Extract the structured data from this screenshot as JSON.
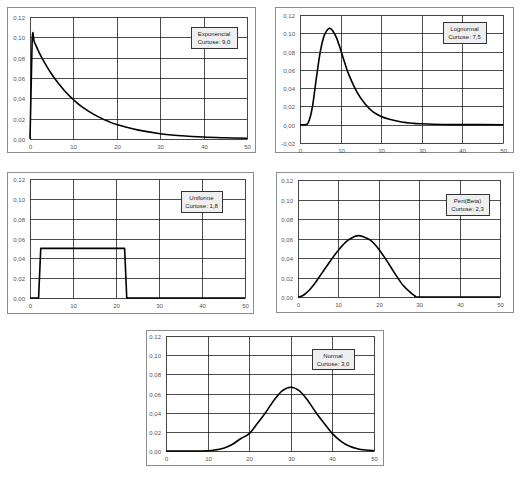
{
  "chart_data": [
    {
      "id": "exponencial",
      "type": "line",
      "title": "",
      "annotation": [
        "Exponencial",
        "Curtose: 9,0"
      ],
      "xlabel": "",
      "ylabel": "",
      "xlim": [
        0,
        50
      ],
      "ylim": [
        0,
        0.12
      ],
      "xticks": [
        "0",
        "10",
        "20",
        "30",
        "40",
        "50"
      ],
      "yticks": [
        "0,00",
        "0,02",
        "0,04",
        "0,06",
        "0,08",
        "0,10",
        "0,12"
      ],
      "grid": true,
      "legend": "none",
      "x": [
        0,
        0.5,
        1,
        2,
        3,
        4,
        5,
        6,
        8,
        10,
        12,
        15,
        18,
        20,
        25,
        30,
        35,
        40,
        45,
        50
      ],
      "values": [
        0,
        0.098,
        0.0953,
        0.086,
        0.0778,
        0.0704,
        0.0637,
        0.0577,
        0.0472,
        0.0387,
        0.0316,
        0.0235,
        0.0174,
        0.0142,
        0.0087,
        0.0052,
        0.0032,
        0.0019,
        0.0012,
        0.0007
      ]
    },
    {
      "id": "lognormal",
      "type": "line",
      "title": "",
      "annotation": [
        "Lognormal",
        "Curtose: 7,5"
      ],
      "xlabel": "",
      "ylabel": "",
      "xlim": [
        0,
        50
      ],
      "ylim": [
        -0.02,
        0.12
      ],
      "xticks": [
        "0",
        "10",
        "20",
        "30",
        "40",
        "50"
      ],
      "yticks": [
        "-0,02",
        "0,00",
        "0,02",
        "0,04",
        "0,06",
        "0,08",
        "0,10",
        "0,12"
      ],
      "grid": true,
      "legend": "none",
      "x": [
        0,
        1,
        2,
        3,
        4,
        5,
        6,
        7,
        7.5,
        8,
        9,
        10,
        11,
        12,
        14,
        16,
        18,
        20,
        22,
        25,
        28,
        30,
        35,
        40,
        50
      ],
      "values": [
        0,
        0,
        0.002,
        0.018,
        0.05,
        0.08,
        0.098,
        0.105,
        0.105,
        0.103,
        0.095,
        0.082,
        0.068,
        0.055,
        0.036,
        0.023,
        0.014,
        0.009,
        0.006,
        0.003,
        0.0015,
        0.001,
        0.0003,
        0.0001,
        0
      ]
    },
    {
      "id": "uniforme",
      "type": "line",
      "title": "",
      "annotation": [
        "Uniforme",
        "Curtose: 1,8"
      ],
      "xlabel": "",
      "ylabel": "",
      "xlim": [
        0,
        50
      ],
      "ylim": [
        0,
        0.12
      ],
      "xticks": [
        "0",
        "10",
        "20",
        "30",
        "40",
        "50"
      ],
      "yticks": [
        "0,00",
        "0,02",
        "0,04",
        "0,06",
        "0,08",
        "0,10",
        "0,12"
      ],
      "grid": true,
      "legend": "none",
      "x": [
        0,
        2,
        2.5,
        22,
        22.5,
        50
      ],
      "values": [
        0,
        0,
        0.05,
        0.05,
        0,
        0
      ]
    },
    {
      "id": "pert-beta",
      "type": "line",
      "title": "",
      "annotation": [
        "Pert(Beta)",
        "Curtose: 2,3"
      ],
      "xlabel": "",
      "ylabel": "",
      "xlim": [
        0,
        50
      ],
      "ylim": [
        0,
        0.12
      ],
      "xticks": [
        "0",
        "10",
        "20",
        "30",
        "40",
        "50"
      ],
      "yticks": [
        "0,00",
        "0,02",
        "0,04",
        "0,06",
        "0,08",
        "0,10",
        "0,12"
      ],
      "grid": true,
      "legend": "none",
      "x": [
        0,
        1,
        2,
        3,
        4,
        5,
        6,
        8,
        10,
        12,
        14,
        15,
        16,
        18,
        20,
        22,
        24,
        26,
        28,
        29,
        30,
        40,
        50
      ],
      "values": [
        0,
        0.001,
        0.004,
        0.008,
        0.013,
        0.019,
        0.025,
        0.037,
        0.048,
        0.057,
        0.062,
        0.063,
        0.062,
        0.058,
        0.049,
        0.037,
        0.024,
        0.012,
        0.004,
        0.001,
        0,
        0,
        0
      ]
    },
    {
      "id": "normal",
      "type": "line",
      "title": "",
      "annotation": [
        "Normal",
        "Curtose: 3,0"
      ],
      "xlabel": "",
      "ylabel": "",
      "xlim": [
        0,
        50
      ],
      "ylim": [
        0,
        0.12
      ],
      "xticks": [
        "0",
        "10",
        "20",
        "30",
        "40",
        "50"
      ],
      "yticks": [
        "0,00",
        "0,02",
        "0,04",
        "0,06",
        "0,08",
        "0,10",
        "0,12"
      ],
      "grid": true,
      "legend": "none",
      "x": [
        0,
        5,
        10,
        12,
        14,
        16,
        18,
        20,
        22,
        24,
        26,
        28,
        30,
        32,
        34,
        36,
        38,
        40,
        42,
        44,
        46,
        48,
        50
      ],
      "values": [
        0,
        0,
        0.0003,
        0.0012,
        0.0032,
        0.0071,
        0.013,
        0.0181,
        0.0289,
        0.0404,
        0.0532,
        0.0629,
        0.0665,
        0.0629,
        0.0532,
        0.0404,
        0.0289,
        0.0181,
        0.0104,
        0.0052,
        0.0024,
        0.001,
        0.0003
      ]
    }
  ],
  "layout": {
    "frames": [
      {
        "x": 7,
        "y": 7,
        "w": 248,
        "h": 145,
        "plot": {
          "l": 30,
          "t": 17,
          "r": 247,
          "b": 139
        },
        "box": {
          "x": 191,
          "y": 27,
          "w": 46,
          "h": 21
        }
      },
      {
        "x": 275,
        "y": 7,
        "w": 238,
        "h": 145,
        "plot": {
          "l": 300,
          "t": 15,
          "r": 503,
          "b": 143
        },
        "box": {
          "x": 443,
          "y": 22,
          "w": 43,
          "h": 21
        }
      },
      {
        "x": 7,
        "y": 172,
        "w": 246,
        "h": 141,
        "plot": {
          "l": 30,
          "t": 179,
          "r": 245,
          "b": 298
        },
        "box": {
          "x": 181,
          "y": 191,
          "w": 41,
          "h": 21
        }
      },
      {
        "x": 276,
        "y": 172,
        "w": 237,
        "h": 140,
        "plot": {
          "l": 298,
          "t": 180,
          "r": 500,
          "b": 297
        },
        "box": {
          "x": 446,
          "y": 194,
          "w": 43,
          "h": 21
        }
      },
      {
        "x": 146,
        "y": 330,
        "w": 237,
        "h": 135,
        "plot": {
          "l": 166,
          "t": 336,
          "r": 374,
          "b": 451
        },
        "box": {
          "x": 312,
          "y": 349,
          "w": 42,
          "h": 20
        }
      }
    ],
    "colors": {
      "frame": "#8c8c8c",
      "grid": "#000000",
      "line": "#000000",
      "tick_text": "#555555",
      "box_fill": "#efefef",
      "box_stroke": "#333333"
    }
  }
}
